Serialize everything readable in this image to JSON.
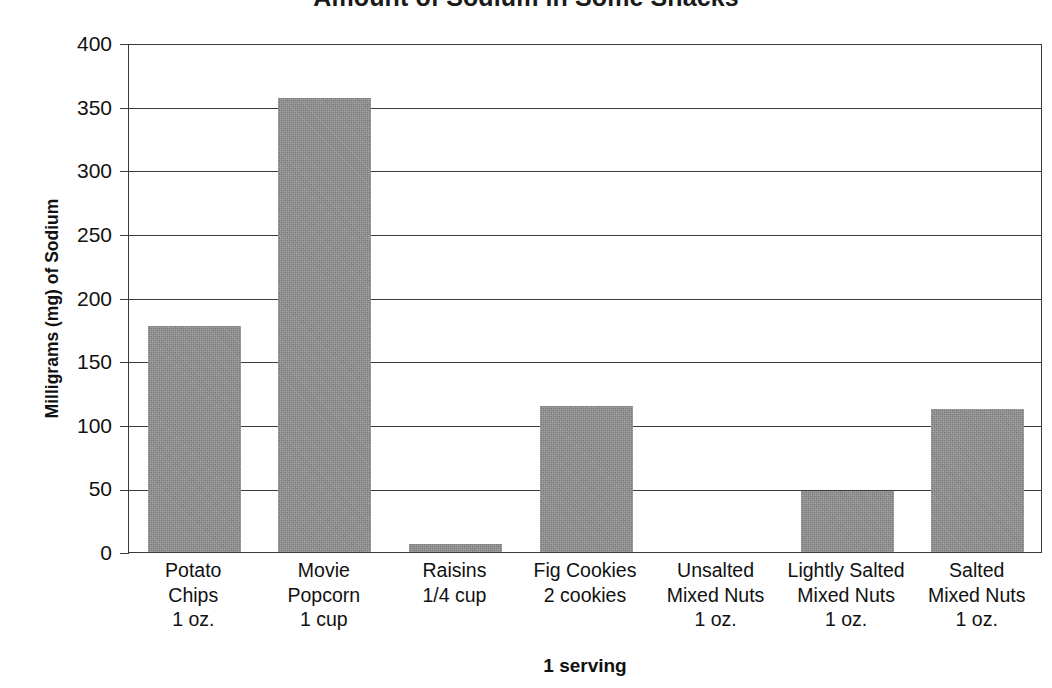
{
  "chart_data": {
    "type": "bar",
    "title": "Amount of Sodium in Some Snacks",
    "xlabel": "1 serving",
    "ylabel": "Milligrams (mg) of Sodium",
    "categories": [
      "Potato\nChips\n1 oz.",
      "Movie\nPopcorn\n1 cup",
      "Raisins\n1/4 cup",
      "Fig Cookies\n2 cookies",
      "Unsalted\nMixed Nuts\n1 oz.",
      "Lightly Salted\nMixed Nuts\n1 oz.",
      "Salted\nMixed Nuts\n1 oz."
    ],
    "category_lines": [
      [
        "Potato",
        "Chips",
        "1 oz."
      ],
      [
        "Movie",
        "Popcorn",
        "1 cup"
      ],
      [
        "Raisins",
        "1/4 cup"
      ],
      [
        "Fig Cookies",
        "2 cookies"
      ],
      [
        "Unsalted",
        "Mixed Nuts",
        "1 oz."
      ],
      [
        "Lightly Salted",
        "Mixed Nuts",
        "1 oz."
      ],
      [
        "Salted",
        "Mixed Nuts",
        "1 oz."
      ]
    ],
    "values": [
      178,
      357,
      6,
      115,
      0,
      48,
      112
    ],
    "ylim": [
      0,
      400
    ],
    "yticks": [
      0,
      50,
      100,
      150,
      200,
      250,
      300,
      350,
      400
    ],
    "ytick_labels": [
      "0",
      "50",
      "100",
      "150",
      "200",
      "250",
      "300",
      "350",
      "400"
    ],
    "grid": true,
    "legend": false,
    "bar_color": "#8d8d8d",
    "axis_color": "#3a3a3a",
    "text_color": "#111111"
  }
}
